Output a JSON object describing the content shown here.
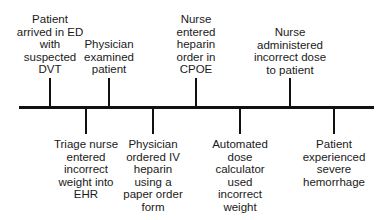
{
  "events_above": [
    {
      "label": "Patient\narrived in ED\nwith\nsuspected\nDVT"
    },
    {
      "label": "Physician\nexamined\npatient"
    },
    {
      "label": "Nurse\nentered\nheparin\norder in\nCPOE"
    },
    {
      "label": "Nurse\nadministered\nincorrect dose\nto patient"
    }
  ],
  "events_below": [
    {
      "label": "Triage nurse\nentered\nincorrect\nweight into\nEHR"
    },
    {
      "label": "Physician\nordered IV\nheparin\nusing a\npaper order\nform"
    },
    {
      "label": "Automated\ndose\ncalculator\nused\nincorrect\nweight"
    },
    {
      "label": "Patient\nexperienced\nsevere\nhemorrhage"
    }
  ]
}
